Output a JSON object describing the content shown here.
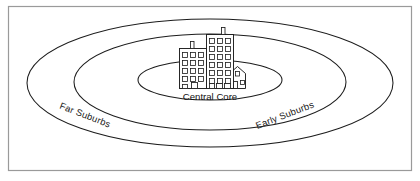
{
  "figure": {
    "type": "concentric-zone-diagram",
    "background_color": "#ffffff",
    "frame": {
      "border_color": "#9a9a9a",
      "fill_color": "#ffffff",
      "x": 8,
      "y": 6,
      "width": 404,
      "height": 165
    },
    "line_color": "#1c1c1c",
    "zones": [
      {
        "id": "central-core",
        "label": "Central Core",
        "ring_index": 1,
        "cx": 210,
        "cy": 80,
        "rx": 72,
        "ry": 20,
        "label_x": 210,
        "label_y": 100,
        "label_rotation": 0
      },
      {
        "id": "early-suburbs",
        "label": "Early Suburbs",
        "ring_index": 2,
        "cx": 210,
        "cy": 82,
        "rx": 136,
        "ry": 48,
        "label_x": 286,
        "label_y": 118,
        "label_rotation": -21
      },
      {
        "id": "far-suburbs",
        "label": "Far Suburbs",
        "ring_index": 3,
        "cx": 210,
        "cy": 83,
        "rx": 183,
        "ry": 64,
        "label_x": 84,
        "label_y": 118,
        "label_rotation": 21
      }
    ],
    "icon": {
      "name": "city-buildings-icon",
      "description": "Cluster of three city buildings with windows at the centre of the innermost zone",
      "buildings": [
        {
          "name": "left-midrise",
          "floors": 5,
          "windows_per_floor": 3
        },
        {
          "name": "center-tower",
          "floors": 7,
          "windows_per_floor": 3
        },
        {
          "name": "right-house",
          "floors": 1,
          "windows_per_floor": 2
        }
      ]
    }
  }
}
